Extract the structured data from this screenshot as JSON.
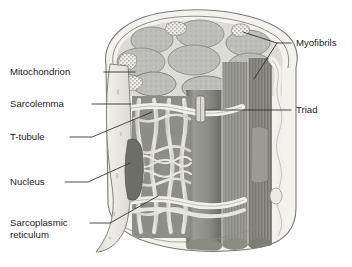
{
  "figure": {
    "background_color": "#ffffff",
    "line_color": "#2b2b2b",
    "palette": {
      "sarcolemma": "#e9e8e3",
      "sarcolemma_shadow": "#cfcec7",
      "myofibril_light": "#bcbcba",
      "myofibril_mid": "#9a9a98",
      "myofibril_dark": "#7e7e7c",
      "reticulum": "#ded f",
      "reticulum_light": "#e4e3de",
      "nucleus": "#6f6f6d",
      "outline": "#6a6a68"
    }
  },
  "labels": [
    {
      "id": "myofibrils",
      "text": "Myofibrils",
      "side": "right",
      "text_x": 296,
      "text_y": 46,
      "leader": "M291,43 L277,43 L243,32 M277,43 L254,79"
    },
    {
      "id": "mitochondrion",
      "text": "Mitochondrion",
      "side": "left",
      "text_x": 10,
      "text_y": 75,
      "leader": "M104,72 L135,72"
    },
    {
      "id": "sarcolemma",
      "text": "Sarcolemma",
      "side": "left",
      "text_x": 10,
      "text_y": 107,
      "leader": "M92,104 L131,104"
    },
    {
      "id": "triad",
      "text": "Triad",
      "side": "right",
      "text_x": 296,
      "text_y": 113,
      "leader": "M291,110 L205,110"
    },
    {
      "id": "t-tubule",
      "text": "T-tubule",
      "side": "left",
      "text_x": 10,
      "text_y": 140,
      "leader": "M70,137 L92,137 L152,112"
    },
    {
      "id": "nucleus",
      "text": "Nucleus",
      "side": "left",
      "text_x": 10,
      "text_y": 185,
      "leader": "M65,182 L88,182 L130,163"
    },
    {
      "id": "sarcoplasmic-reticulum",
      "text": "Sarcoplasmic",
      "text_line2": "reticulum",
      "side": "left",
      "text_x": 10,
      "text_y": 226,
      "text_y2": 238,
      "leader": "M90,223 L110,223 L158,196"
    }
  ]
}
